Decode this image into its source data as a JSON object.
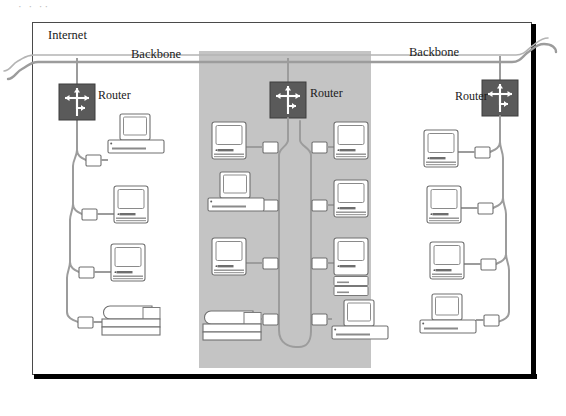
{
  "figure": {
    "caption_sliver": "· ·   ··",
    "area_label": "Internet",
    "backbone_left_label": "Backbone",
    "backbone_right_label": "Backbone",
    "colors": {
      "shaded_band": "#c4c4c4",
      "router_fill": "#5a5a5a",
      "device_outline": "#6e6e6e",
      "device_fill": "#ffffff",
      "cable": "#9a9a9a",
      "frame": "#4a4a4a",
      "rule": "#000000",
      "text": "#1a1a1a"
    }
  },
  "routers": [
    {
      "id": "router-left",
      "label": "Router",
      "label_side": "right"
    },
    {
      "id": "router-mid",
      "label": "Router",
      "label_side": "right"
    },
    {
      "id": "router-right",
      "label": "Router",
      "label_side": "left"
    }
  ],
  "segments": [
    {
      "id": "segment-left",
      "shaded": false,
      "router": "router-left",
      "devices": [
        {
          "id": "dev-l1",
          "type": "desktop-pc",
          "icon": "desktop-computer-icon"
        },
        {
          "id": "dev-l2",
          "type": "all-in-one",
          "icon": "macintosh-computer-icon"
        },
        {
          "id": "dev-l3",
          "type": "all-in-one",
          "icon": "macintosh-computer-icon"
        },
        {
          "id": "dev-l4",
          "type": "printer",
          "icon": "printer-icon"
        }
      ]
    },
    {
      "id": "segment-middle",
      "shaded": true,
      "router": "router-mid",
      "devices": [
        {
          "id": "dev-ml1",
          "type": "all-in-one",
          "icon": "macintosh-computer-icon"
        },
        {
          "id": "dev-ml2",
          "type": "desktop-pc",
          "icon": "desktop-computer-icon"
        },
        {
          "id": "dev-ml3",
          "type": "all-in-one",
          "icon": "macintosh-computer-icon"
        },
        {
          "id": "dev-ml4",
          "type": "printer",
          "icon": "printer-icon"
        },
        {
          "id": "dev-mr1",
          "type": "all-in-one",
          "icon": "macintosh-computer-icon"
        },
        {
          "id": "dev-mr2",
          "type": "all-in-one",
          "icon": "macintosh-computer-icon"
        },
        {
          "id": "dev-mr3",
          "type": "tower-pc",
          "icon": "tower-computer-icon"
        },
        {
          "id": "dev-mr4",
          "type": "desktop-pc",
          "icon": "desktop-computer-icon"
        }
      ]
    },
    {
      "id": "segment-right",
      "shaded": false,
      "router": "router-right",
      "devices": [
        {
          "id": "dev-r1",
          "type": "all-in-one",
          "icon": "macintosh-computer-icon"
        },
        {
          "id": "dev-r2",
          "type": "all-in-one",
          "icon": "macintosh-computer-icon"
        },
        {
          "id": "dev-r3",
          "type": "all-in-one",
          "icon": "macintosh-computer-icon"
        },
        {
          "id": "dev-r4",
          "type": "desktop-pc",
          "icon": "desktop-computer-icon"
        }
      ]
    }
  ]
}
